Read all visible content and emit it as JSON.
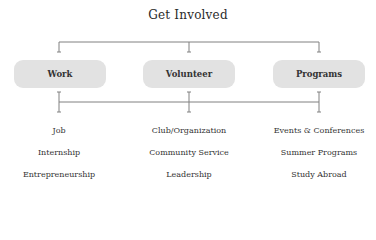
{
  "title": "Get Involved",
  "categories": [
    {
      "label": "Work",
      "items": [
        "Job",
        "Internship",
        "Entrepreneurship"
      ]
    },
    {
      "label": "Volunteer",
      "items": [
        "Club/Organization",
        "Community Service",
        "Leadership"
      ]
    },
    {
      "label": "Programs",
      "items": [
        "Events & Conferences",
        "Summer Programs",
        "Study Abroad"
      ]
    }
  ],
  "colors": {
    "box_fill": "#e2e2e2",
    "line": "#777777",
    "text": "#2b2b2b"
  }
}
